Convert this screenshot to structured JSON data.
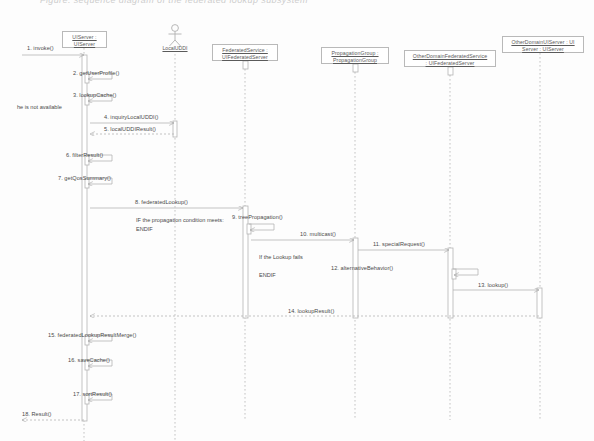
{
  "caption": "Figure: sequence diagram of the federated lookup subsystem",
  "diagram": {
    "type": "uml-sequence-diagram",
    "colors": {
      "line": "#b4b4b4",
      "text": "#4a4a4a",
      "box_border": "#b9b9b9",
      "background": "#fdfdfd",
      "activation_fill": "#ffffff"
    },
    "lifelines": [
      {
        "id": "uiserver",
        "kind": "object",
        "line1": "UIServer :",
        "line2": "UIServer",
        "x": 84,
        "box": {
          "left": 62,
          "top": 31,
          "width": 45,
          "height": 17
        },
        "line_top": 48,
        "line_bottom": 441
      },
      {
        "id": "localuddi",
        "kind": "actor",
        "line1": "LocalUDDI",
        "line2": "",
        "x": 175,
        "box": {
          "left": 152,
          "top": 45,
          "width": 46,
          "height": 9
        },
        "line_top": 54,
        "line_bottom": 441
      },
      {
        "id": "federatedservice",
        "kind": "object",
        "line1": "FederatedService :",
        "line2": "UIFederatedServer",
        "x": 245,
        "box": {
          "left": 212,
          "top": 44,
          "width": 66,
          "height": 17
        },
        "line_top": 61,
        "line_bottom": 420
      },
      {
        "id": "propagationgroup",
        "kind": "object",
        "line1": "PropagationGroup :",
        "line2": "PropagationGroup",
        "x": 355,
        "box": {
          "left": 321,
          "top": 47,
          "width": 68,
          "height": 17
        },
        "line_top": 64,
        "line_bottom": 420
      },
      {
        "id": "otherdomainfederatedservice",
        "kind": "object",
        "line1": "OtherDomainFederatedService",
        "line2": ": UIFederatedServer",
        "x": 450,
        "box": {
          "left": 404,
          "top": 50,
          "width": 92,
          "height": 17
        },
        "line_top": 67,
        "line_bottom": 420
      },
      {
        "id": "otherdomainuiserver",
        "kind": "object",
        "line1": "OtherDomainUIServer : UI",
        "line2": "Server : UIServer",
        "x": 540,
        "box": {
          "left": 502,
          "top": 36,
          "width": 82,
          "height": 17
        },
        "line_top": 53,
        "line_bottom": 420
      }
    ],
    "messages": [
      {
        "seq": "1",
        "label": "1. invoke()",
        "from": "external",
        "to": "uiserver",
        "x1": 22,
        "x2": 84,
        "y": 55,
        "label_x": 27,
        "label_y": 45,
        "kind": "call"
      },
      {
        "seq": "2",
        "label": "2. getUserProfile()",
        "from": "uiserver",
        "to": "uiserver",
        "x1": 87,
        "x2": 112,
        "y": 79,
        "label_x": 73,
        "label_y": 70,
        "kind": "self"
      },
      {
        "seq": "3",
        "label": "3. lookupCache()",
        "from": "uiserver",
        "to": "uiserver",
        "x1": 87,
        "x2": 112,
        "y": 101,
        "label_x": 73,
        "label_y": 92,
        "kind": "self"
      },
      {
        "seq": "4",
        "label": "4. inquiryLocalUDDI()",
        "from": "uiserver",
        "to": "localuddi",
        "x1": 90,
        "x2": 174,
        "y": 123,
        "label_x": 104,
        "label_y": 114,
        "kind": "call"
      },
      {
        "seq": "5",
        "label": "5. localUDDIResult()",
        "from": "localuddi",
        "to": "uiserver",
        "x1": 174,
        "x2": 90,
        "y": 134,
        "label_x": 104,
        "label_y": 126,
        "kind": "return"
      },
      {
        "seq": "6",
        "label": "6. filterResult()",
        "from": "uiserver",
        "to": "uiserver",
        "x1": 87,
        "x2": 112,
        "y": 161,
        "label_x": 66,
        "label_y": 152,
        "kind": "self"
      },
      {
        "seq": "7",
        "label": "7. getQosSummary()",
        "from": "uiserver",
        "to": "uiserver",
        "x1": 87,
        "x2": 112,
        "y": 184,
        "label_x": 58,
        "label_y": 175,
        "kind": "self"
      },
      {
        "seq": "8",
        "label": "8. federatedLookup()",
        "from": "uiserver",
        "to": "federatedservice",
        "x1": 90,
        "x2": 243,
        "y": 208,
        "label_x": 135,
        "label_y": 199,
        "kind": "call"
      },
      {
        "seq": "9",
        "label": "9. treePropagation()",
        "from": "federatedservice",
        "to": "federatedservice",
        "x1": 249,
        "x2": 274,
        "y": 230,
        "label_x": 232,
        "label_y": 214,
        "kind": "self"
      },
      {
        "seq": "10",
        "label": "10. multicast()",
        "from": "federatedservice",
        "to": "propagationgroup",
        "x1": 251,
        "x2": 354,
        "y": 240,
        "label_x": 300,
        "label_y": 231,
        "kind": "call"
      },
      {
        "seq": "11",
        "label": "11. specialRequest()",
        "from": "propagationgroup",
        "to": "otherdomainfederatedservice",
        "x1": 358,
        "x2": 449,
        "y": 250,
        "label_x": 373,
        "label_y": 241,
        "kind": "call"
      },
      {
        "seq": "12",
        "label": "12. alternativeBehavior()",
        "from": "otherdomainfederatedservice",
        "to": "otherdomainfederatedservice",
        "x1": 453,
        "x2": 478,
        "y": 275,
        "label_x": 331,
        "label_y": 265,
        "kind": "self"
      },
      {
        "seq": "13",
        "label": "13. lookup()",
        "from": "otherdomainfederatedservice",
        "to": "otherdomainuiserver",
        "x1": 453,
        "x2": 539,
        "y": 290,
        "label_x": 478,
        "label_y": 282,
        "kind": "call"
      },
      {
        "seq": "14",
        "label": "14. lookupResult()",
        "from": "otherdomainuiserver",
        "to": "uiserver",
        "x1": 539,
        "x2": 90,
        "y": 316,
        "label_x": 288,
        "label_y": 308,
        "kind": "return"
      },
      {
        "seq": "15",
        "label": "15. federatedLookupResultMerge()",
        "from": "uiserver",
        "to": "uiserver",
        "x1": 87,
        "x2": 112,
        "y": 341,
        "label_x": 48,
        "label_y": 332,
        "kind": "self"
      },
      {
        "seq": "16",
        "label": "16. saveCache()",
        "from": "uiserver",
        "to": "uiserver",
        "x1": 87,
        "x2": 112,
        "y": 366,
        "label_x": 68,
        "label_y": 357,
        "kind": "self"
      },
      {
        "seq": "17",
        "label": "17. sortResult()",
        "from": "uiserver",
        "to": "uiserver",
        "x1": 87,
        "x2": 112,
        "y": 400,
        "label_x": 73,
        "label_y": 391,
        "kind": "self"
      },
      {
        "seq": "18",
        "label": "18. Result()",
        "from": "uiserver",
        "to": "external",
        "x1": 84,
        "x2": 22,
        "y": 420,
        "label_x": 22,
        "label_y": 411,
        "kind": "return"
      }
    ],
    "notes": [
      {
        "id": "note-not-available",
        "text": "he is not available",
        "x": 17,
        "y": 103
      },
      {
        "id": "note-propagation-if",
        "text": "IF the propagation condition meets:",
        "x": 136,
        "y": 216
      },
      {
        "id": "note-propagation-endif",
        "text": "ENDIF",
        "x": 136,
        "y": 225
      },
      {
        "id": "note-lookup-fails",
        "text": "If the Lookup fails",
        "x": 259,
        "y": 253
      },
      {
        "id": "note-lookup-endif",
        "text": "ENDIF",
        "x": 259,
        "y": 271
      }
    ],
    "activations": [
      {
        "id": "act-uiserver-main",
        "lifeline": "uiserver",
        "x": 82,
        "y": 55,
        "width": 5,
        "height": 366
      },
      {
        "id": "act-uiserver-2",
        "lifeline": "uiserver",
        "x": 85,
        "y": 73,
        "width": 4,
        "height": 10
      },
      {
        "id": "act-uiserver-3",
        "lifeline": "uiserver",
        "x": 85,
        "y": 95,
        "width": 4,
        "height": 10
      },
      {
        "id": "act-uiserver-6",
        "lifeline": "uiserver",
        "x": 85,
        "y": 155,
        "width": 4,
        "height": 10
      },
      {
        "id": "act-uiserver-7",
        "lifeline": "uiserver",
        "x": 85,
        "y": 178,
        "width": 4,
        "height": 10
      },
      {
        "id": "act-uiserver-15",
        "lifeline": "uiserver",
        "x": 85,
        "y": 335,
        "width": 4,
        "height": 10
      },
      {
        "id": "act-uiserver-16",
        "lifeline": "uiserver",
        "x": 85,
        "y": 360,
        "width": 4,
        "height": 10
      },
      {
        "id": "act-uiserver-17",
        "lifeline": "uiserver",
        "x": 85,
        "y": 394,
        "width": 4,
        "height": 10
      },
      {
        "id": "act-localuddi",
        "lifeline": "localuddi",
        "x": 173,
        "y": 121,
        "width": 4,
        "height": 16
      },
      {
        "id": "act-federated-head",
        "lifeline": "federatedservice",
        "x": 243,
        "y": 61,
        "width": 5,
        "height": 8
      },
      {
        "id": "act-federated-main",
        "lifeline": "federatedservice",
        "x": 243,
        "y": 206,
        "width": 5,
        "height": 112
      },
      {
        "id": "act-federated-self",
        "lifeline": "federatedservice",
        "x": 247,
        "y": 224,
        "width": 4,
        "height": 10
      },
      {
        "id": "act-propagation-head",
        "lifeline": "propagationgroup",
        "x": 353,
        "y": 64,
        "width": 5,
        "height": 8
      },
      {
        "id": "act-propagation-main",
        "lifeline": "propagationgroup",
        "x": 353,
        "y": 238,
        "width": 5,
        "height": 80
      },
      {
        "id": "act-otherfed-head",
        "lifeline": "otherdomainfederatedservice",
        "x": 448,
        "y": 67,
        "width": 5,
        "height": 8
      },
      {
        "id": "act-otherfed-main",
        "lifeline": "otherdomainfederatedservice",
        "x": 448,
        "y": 248,
        "width": 5,
        "height": 70
      },
      {
        "id": "act-otherfed-self",
        "lifeline": "otherdomainfederatedservice",
        "x": 452,
        "y": 269,
        "width": 4,
        "height": 10
      },
      {
        "id": "act-otheruiserver",
        "lifeline": "otherdomainuiserver",
        "x": 537,
        "y": 288,
        "width": 5,
        "height": 30
      }
    ]
  }
}
